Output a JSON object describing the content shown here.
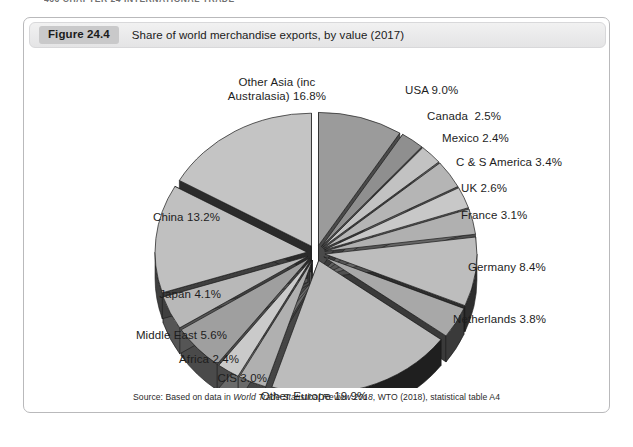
{
  "page": {
    "running_head": "466  CHAPTER 24  INTERNATIONAL TRADE",
    "background_color": "#ffffff"
  },
  "figure": {
    "badge": "Figure 24.4",
    "caption": "Share of world merchandise exports, by value (2017)",
    "source_prefix": "Source: Based on data in ",
    "source_italic": "World Trade Statistical Review 2018",
    "source_suffix": ", WTO (2018), statistical table A4",
    "border_color": "#b9b9bb",
    "header_color": "#e9e9ea",
    "badge_color": "#c9c9ca"
  },
  "chart_data": {
    "type": "pie",
    "title": "Share of world merchandise exports, by value (2017)",
    "units": "percent",
    "exploded": true,
    "three_d": true,
    "start_angle_deg": -90,
    "direction": "clockwise",
    "legend": "none (direct labels)",
    "categories": [
      "USA",
      "Canada",
      "Mexico",
      "C & S America",
      "UK",
      "France",
      "Germany",
      "Netherlands",
      "Other Europe",
      "CIS",
      "Africa",
      "Middle East",
      "Japan",
      "China",
      "Other Asia (inc Australasia)"
    ],
    "values": [
      9.0,
      2.5,
      2.4,
      3.4,
      2.6,
      3.1,
      8.4,
      3.8,
      19.9,
      3.0,
      2.4,
      5.6,
      4.1,
      13.2,
      16.8
    ],
    "slices": [
      {
        "label": "USA 9.0%",
        "name": "USA",
        "value": 9.0,
        "top_color": "#9b9b9b",
        "side_color": "#4a4a4a"
      },
      {
        "label": "Canada  2.5%",
        "name": "Canada",
        "value": 2.5,
        "top_color": "#8f8f8f",
        "side_color": "#3c3c3c"
      },
      {
        "label": "Mexico 2.4%",
        "name": "Mexico",
        "value": 2.4,
        "top_color": "#c2c2c2",
        "side_color": "#5e5e5e"
      },
      {
        "label": "C & S America 3.4%",
        "name": "C & S America",
        "value": 3.4,
        "top_color": "#b5b5b5",
        "side_color": "#565656"
      },
      {
        "label": "UK 2.6%",
        "name": "UK",
        "value": 2.6,
        "top_color": "#c8c8c8",
        "side_color": "#666666"
      },
      {
        "label": "France 3.1%",
        "name": "France",
        "value": 3.1,
        "top_color": "#b0b0b0",
        "side_color": "#4f4f4f"
      },
      {
        "label": "Germany 8.4%",
        "name": "Germany",
        "value": 8.4,
        "top_color": "#bdbdbd",
        "side_color": "#2e2e2e"
      },
      {
        "label": "Netherlands 3.8%",
        "name": "Netherlands",
        "value": 3.8,
        "top_color": "#a8a8a8",
        "side_color": "#3a3a3a"
      },
      {
        "label": "Other Europe 19.9%",
        "name": "Other Europe",
        "value": 19.9,
        "top_color": "#bcbcbc",
        "side_color": "#1f1f1f"
      },
      {
        "label": "CIS 3.0%",
        "name": "CIS",
        "value": 3.0,
        "top_color": "#b0b0b0",
        "side_color": "#454545"
      },
      {
        "label": "Africa 2.4%",
        "name": "Africa",
        "value": 2.4,
        "top_color": "#cacaca",
        "side_color": "#6a6a6a"
      },
      {
        "label": "Middle East 5.6%",
        "name": "Middle East",
        "value": 5.6,
        "top_color": "#9f9f9f",
        "side_color": "#4a4a4a"
      },
      {
        "label": "Japan 4.1%",
        "name": "Japan",
        "value": 4.1,
        "top_color": "#b8b8b8",
        "side_color": "#555555"
      },
      {
        "label": "China 13.2%",
        "name": "China",
        "value": 13.2,
        "top_color": "#c0c0c0",
        "side_color": "#3f3f3f"
      },
      {
        "label": "Other Asia (inc\nAustralasia) 16.8%",
        "name": "Other Asia (inc Australasia)",
        "value": 16.8,
        "top_color": "#c4c4c4",
        "side_color": "#2b2b2b"
      }
    ]
  }
}
